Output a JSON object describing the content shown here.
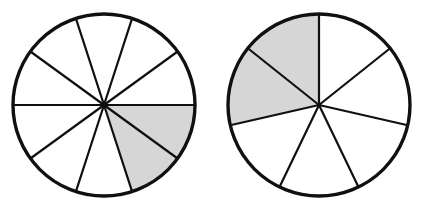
{
  "figure": {
    "title": "",
    "background_color": "#ffffff",
    "outline_color": "#101010",
    "shaded_color": "#d6d6d6",
    "unshaded_color": "#ffffff",
    "width": 426,
    "height": 211
  },
  "chart_data": {
    "type": "pie",
    "title": "",
    "xlabel": "",
    "ylabel": "",
    "charts": [
      {
        "name": "left-fraction-circle",
        "center_x": 104,
        "center_y": 105,
        "radius": 91,
        "total_sectors": 10,
        "shaded_sectors": 2,
        "sector_angle_degrees": 36,
        "start_angle_degrees": 180,
        "fraction_label": "2/10",
        "categories": [
          "s1",
          "s2",
          "s3",
          "s4",
          "s5",
          "s6",
          "s7",
          "s8",
          "s9",
          "s10"
        ],
        "values": [
          1,
          1,
          1,
          1,
          1,
          1,
          1,
          1,
          1,
          1
        ],
        "shaded_flags": [
          false,
          false,
          false,
          true,
          true,
          false,
          false,
          false,
          false,
          false
        ]
      },
      {
        "name": "right-fraction-circle",
        "center_x": 319,
        "center_y": 105,
        "radius": 91,
        "total_sectors": 7,
        "shaded_sectors": 2,
        "sector_angle_degrees": 51.4285714,
        "start_angle_degrees": 90,
        "fraction_label": "2/7",
        "categories": [
          "s1",
          "s2",
          "s3",
          "s4",
          "s5",
          "s6",
          "s7"
        ],
        "values": [
          1,
          1,
          1,
          1,
          1,
          1,
          1
        ],
        "shaded_flags": [
          true,
          true,
          false,
          false,
          false,
          false,
          false
        ]
      }
    ]
  }
}
